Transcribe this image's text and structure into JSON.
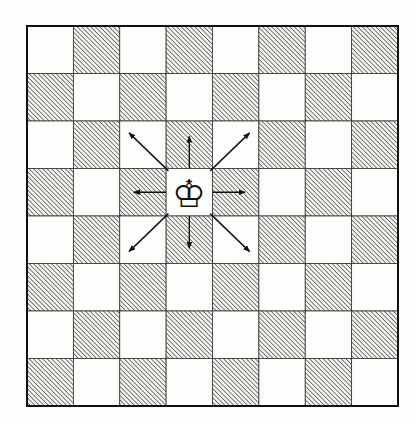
{
  "diagram": {
    "board": {
      "files": 8,
      "ranks": 8,
      "top_left_color": "light",
      "light_color": "#fdfdfb",
      "dark_hatch_color": "#4a4a4a",
      "line_color": "#1a1a1a"
    },
    "piece": {
      "name": "king",
      "color": "white",
      "glyph": "♔",
      "row": 3,
      "col": 3
    },
    "arrows": [
      {
        "direction": "up-left"
      },
      {
        "direction": "up"
      },
      {
        "direction": "up-right"
      },
      {
        "direction": "left"
      },
      {
        "direction": "right"
      },
      {
        "direction": "down-left"
      },
      {
        "direction": "down"
      },
      {
        "direction": "down-right"
      }
    ]
  }
}
